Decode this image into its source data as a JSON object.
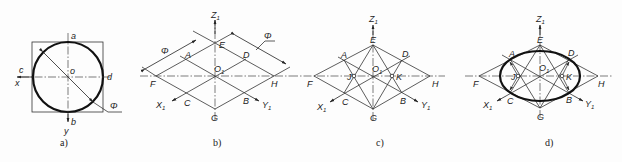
{
  "figure": {
    "panels": [
      {
        "id": "a",
        "caption": "a)",
        "description": "Circle inscribed in square with center lines",
        "labels": {
          "a": "a",
          "b": "b",
          "c": "c",
          "d": "d",
          "o": "o",
          "x": "x",
          "y": "y",
          "phi": "Φ"
        }
      },
      {
        "id": "b",
        "caption": "b)",
        "description": "Isometric rhombus construction with axes",
        "labels": {
          "Z1": "Z",
          "X1": "X",
          "Y1": "Y",
          "O1": "O",
          "sub": "1",
          "A": "A",
          "B": "B",
          "C": "C",
          "D": "D",
          "E": "E",
          "F": "F",
          "G": "G",
          "H": "H",
          "phi1": "Φ",
          "phi2": "Φ"
        }
      },
      {
        "id": "c",
        "caption": "c)",
        "description": "Rhombus with connecting lines and centers J, K",
        "labels": {
          "Z1": "Z",
          "X1": "X",
          "Y1": "Y",
          "O1": "O",
          "sub": "1",
          "A": "A",
          "B": "B",
          "C": "C",
          "D": "D",
          "E": "E",
          "F": "F",
          "G": "G",
          "H": "H",
          "J": "J",
          "K": "K"
        }
      },
      {
        "id": "d",
        "caption": "d)",
        "description": "Approximate isometric ellipse by four-center method",
        "labels": {
          "Z1": "Z",
          "X1": "X",
          "Y1": "Y",
          "O1": "O",
          "sub": "1",
          "A": "A",
          "B": "B",
          "C": "C",
          "D": "D",
          "E": "E",
          "F": "F",
          "G": "G",
          "H": "H",
          "J": "J",
          "K": "K"
        }
      }
    ]
  }
}
